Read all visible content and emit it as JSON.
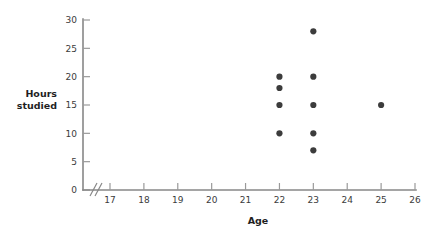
{
  "chart_data": {
    "type": "scatter",
    "title": "",
    "xlabel": "Age",
    "ylabel": "Hours studied",
    "ylabel_lines": [
      "Hours",
      "studied"
    ],
    "xlim": [
      17,
      26
    ],
    "ylim": [
      0,
      30
    ],
    "x_ticks": [
      17,
      18,
      19,
      20,
      21,
      22,
      23,
      24,
      25,
      26
    ],
    "y_ticks": [
      0,
      5,
      10,
      15,
      20,
      25,
      30
    ],
    "x_tick_labels": [
      "17",
      "18",
      "19",
      "20",
      "21",
      "22",
      "23",
      "24",
      "25",
      "26"
    ],
    "y_tick_labels": [
      "0",
      "5",
      "10",
      "15",
      "20",
      "25",
      "30"
    ],
    "grid": false,
    "legend": false,
    "axis_break_x": true,
    "axis_break_note": "//",
    "point_color": "#3c3c3c",
    "axis_color": "#878787",
    "background_color": "#ffffff",
    "points": [
      {
        "x": 22,
        "y": 20
      },
      {
        "x": 22,
        "y": 18
      },
      {
        "x": 22,
        "y": 15
      },
      {
        "x": 22,
        "y": 10
      },
      {
        "x": 23,
        "y": 28
      },
      {
        "x": 23,
        "y": 20
      },
      {
        "x": 23,
        "y": 15
      },
      {
        "x": 23,
        "y": 10
      },
      {
        "x": 23,
        "y": 7
      },
      {
        "x": 25,
        "y": 15
      }
    ]
  }
}
